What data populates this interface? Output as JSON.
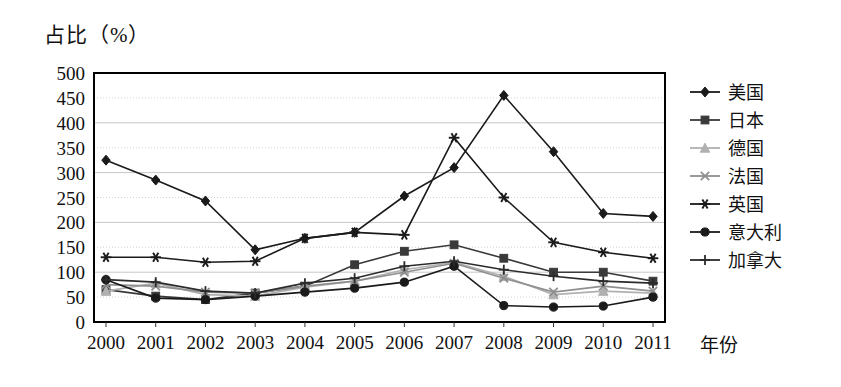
{
  "axis": {
    "y_title": "占比（%）",
    "x_title": "年份",
    "y_ticks": [
      "500",
      "450",
      "400",
      "350",
      "300",
      "250",
      "200",
      "150",
      "100",
      "50",
      "0"
    ],
    "x_ticks": [
      "2000",
      "2001",
      "2002",
      "2003",
      "2004",
      "2005",
      "2006",
      "2007",
      "2008",
      "2009",
      "2010",
      "2011"
    ]
  },
  "legend": {
    "items": [
      {
        "label": "美国",
        "marker": "diamond-marker",
        "color": "#1a1a1a"
      },
      {
        "label": "日本",
        "marker": "square-marker",
        "color": "#3a3a3a"
      },
      {
        "label": "德国",
        "marker": "triangle-marker",
        "color": "#b0b0b0"
      },
      {
        "label": "法国",
        "marker": "cross-x-marker",
        "color": "#8f8f8f"
      },
      {
        "label": "英国",
        "marker": "asterisk-marker",
        "color": "#1a1a1a"
      },
      {
        "label": "意大利",
        "marker": "circle-marker",
        "color": "#1a1a1a"
      },
      {
        "label": "加拿大",
        "marker": "plus-marker",
        "color": "#2b2b2b"
      }
    ]
  },
  "chart_data": {
    "type": "line",
    "title": "",
    "xlabel": "年份",
    "ylabel": "占比（%）",
    "ylim": [
      0,
      500
    ],
    "ytick_step": 50,
    "grid": true,
    "legend_position": "right",
    "categories": [
      "2000",
      "2001",
      "2002",
      "2003",
      "2004",
      "2005",
      "2006",
      "2007",
      "2008",
      "2009",
      "2010",
      "2011"
    ],
    "series": [
      {
        "name": "美国",
        "marker": "diamond",
        "color": "#1a1a1a",
        "values": [
          325,
          285,
          243,
          145,
          168,
          180,
          253,
          310,
          455,
          342,
          218,
          212
        ]
      },
      {
        "name": "日本",
        "marker": "square",
        "color": "#3a3a3a",
        "values": [
          65,
          52,
          45,
          58,
          72,
          115,
          142,
          155,
          128,
          100,
          100,
          82
        ]
      },
      {
        "name": "德国",
        "marker": "triangle",
        "color": "#b0b0b0",
        "values": [
          62,
          78,
          55,
          52,
          70,
          82,
          105,
          120,
          92,
          55,
          62,
          58
        ]
      },
      {
        "name": "法国",
        "marker": "cross-x",
        "color": "#8f8f8f",
        "values": [
          75,
          72,
          60,
          58,
          72,
          82,
          100,
          118,
          88,
          60,
          72,
          62
        ]
      },
      {
        "name": "英国",
        "marker": "asterisk",
        "color": "#1a1a1a",
        "values": [
          130,
          130,
          120,
          122,
          168,
          180,
          175,
          370,
          250,
          160,
          140,
          128
        ]
      },
      {
        "name": "意大利",
        "marker": "circle",
        "color": "#1a1a1a",
        "values": [
          85,
          48,
          45,
          52,
          60,
          68,
          80,
          112,
          33,
          30,
          32,
          50
        ]
      },
      {
        "name": "加拿大",
        "marker": "plus",
        "color": "#2b2b2b",
        "values": [
          85,
          80,
          62,
          58,
          78,
          88,
          112,
          122,
          105,
          92,
          82,
          78
        ]
      }
    ]
  }
}
